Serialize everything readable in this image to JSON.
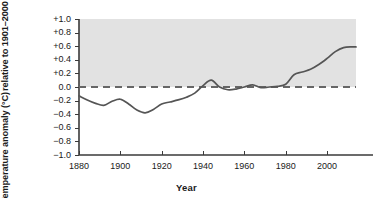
{
  "chart_data": {
    "type": "line",
    "title": "",
    "xlabel": "Year",
    "ylabel_line1": "Temperature anomaly (°C)",
    "ylabel_line2": "relative to 1901–2000 average",
    "xlim": [
      1880,
      2014
    ],
    "ylim": [
      -1.0,
      1.0
    ],
    "xticks": [
      1880,
      1900,
      1920,
      1940,
      1960,
      1980,
      2000
    ],
    "xtick_labels": [
      "1880",
      "1900",
      "1920",
      "1940",
      "1960",
      "1980",
      "2000"
    ],
    "yticks": [
      1.0,
      0.8,
      0.6,
      0.4,
      0.2,
      0.0,
      -0.2,
      -0.4,
      -0.6,
      -0.8,
      -1.0
    ],
    "ytick_labels": [
      "+1.0",
      "+0.8",
      "+0.6",
      "+0.4",
      "+0.2",
      "0.0",
      "−0.2",
      "−0.4",
      "−0.6",
      "−0.8",
      "−1.0"
    ],
    "grid": false,
    "legend": null,
    "shaded_band": {
      "from": 0.0,
      "to": 1.0,
      "color": "#e2e2e2",
      "description": "gray band above the zero reference line"
    },
    "reference_line": {
      "value": 0.0,
      "style": "dashed",
      "color": "#666666"
    },
    "series": [
      {
        "name": "Global temperature anomaly",
        "color": "#555555",
        "x": [
          1880,
          1884,
          1888,
          1892,
          1896,
          1900,
          1904,
          1908,
          1912,
          1916,
          1920,
          1924,
          1928,
          1932,
          1936,
          1940,
          1944,
          1948,
          1952,
          1956,
          1960,
          1964,
          1968,
          1972,
          1976,
          1980,
          1984,
          1988,
          1992,
          1996,
          2000,
          2004,
          2008,
          2012,
          2014
        ],
        "y": [
          -0.13,
          -0.19,
          -0.24,
          -0.27,
          -0.21,
          -0.18,
          -0.25,
          -0.34,
          -0.38,
          -0.33,
          -0.25,
          -0.22,
          -0.19,
          -0.15,
          -0.09,
          0.02,
          0.1,
          0.0,
          -0.04,
          -0.03,
          0.0,
          0.03,
          -0.01,
          0.0,
          0.01,
          0.04,
          0.18,
          0.22,
          0.26,
          0.33,
          0.42,
          0.52,
          0.58,
          0.59,
          0.59
        ]
      }
    ]
  },
  "axes": {
    "tick_color": "#3a3a3a"
  }
}
